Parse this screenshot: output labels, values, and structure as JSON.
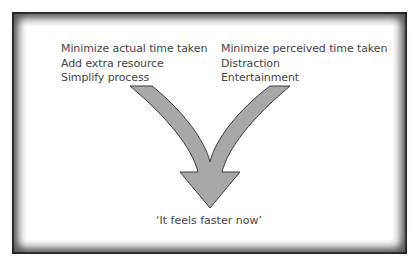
{
  "diagram": {
    "left_column": {
      "heading": "Minimize actual time taken",
      "items": [
        "Add extra resource",
        "Simplify process"
      ]
    },
    "right_column": {
      "heading": "Minimize perceived time taken",
      "items": [
        "Distraction",
        "Entertainment"
      ]
    },
    "outcome": "‘It feels faster now’",
    "colors": {
      "arrow_fill": "#a8a8a8",
      "arrow_stroke": "#3a3a3a",
      "frame": "#1a1a1a",
      "text": "#444444"
    }
  }
}
